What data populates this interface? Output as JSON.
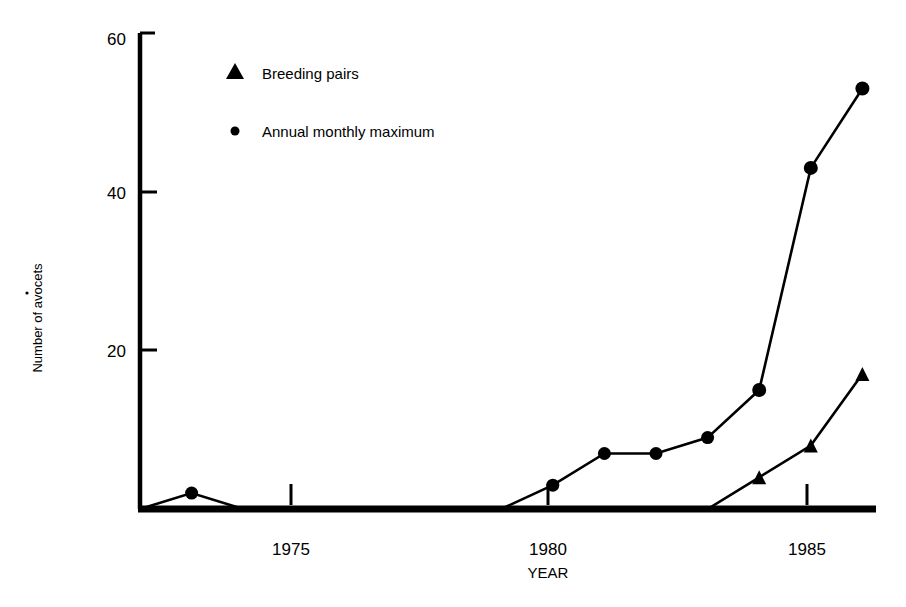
{
  "chart_data": {
    "type": "line",
    "title": "",
    "subtitle": "",
    "xlabel": "YEAR",
    "ylabel": "Number of avocets",
    "xlim": [
      1972,
      1986.5
    ],
    "ylim": [
      0,
      60
    ],
    "xticks": [
      1975,
      1980,
      1985
    ],
    "xtick_labels": [
      "1975",
      "1980",
      "1985"
    ],
    "yticks": [
      20,
      40,
      60
    ],
    "ytick_labels": [
      "20",
      "40",
      "60"
    ],
    "grid": false,
    "legend_position": "top-left-inside",
    "series": [
      {
        "name": "Breeding pairs",
        "marker": "triangle",
        "x": [
          1983,
          1984,
          1985,
          1986
        ],
        "values": [
          0,
          4,
          8,
          17
        ]
      },
      {
        "name": "Annual monthly maximum",
        "marker": "circle",
        "x": [
          1972,
          1973,
          1974,
          1979,
          1980,
          1981,
          1982,
          1983,
          1984,
          1985,
          1986
        ],
        "values": [
          0,
          2,
          0,
          0,
          3,
          7,
          7,
          9,
          15,
          43,
          53
        ]
      }
    ]
  },
  "legend": {
    "items": [
      {
        "marker": "triangle",
        "label": "Breeding pairs"
      },
      {
        "marker": "circle",
        "label": "Annual monthly maximum"
      }
    ]
  },
  "axes": {
    "y_title": "Number of avocets",
    "x_title": "YEAR",
    "y_tick_60": "60",
    "y_tick_40": "40",
    "y_tick_20": "20",
    "x_tick_1975": "1975",
    "x_tick_1980": "1980",
    "x_tick_1985": "1985"
  },
  "colors": {
    "ink": "#000000",
    "paper": "#ffffff"
  }
}
